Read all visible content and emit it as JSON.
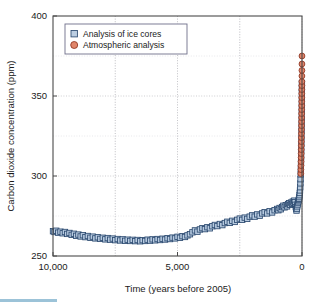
{
  "chart_data": {
    "type": "scatter",
    "title": "",
    "xlabel": "Time (years before 2005)",
    "ylabel": "Carbon dioxide concentration (ppm)",
    "xlim": [
      10000,
      0
    ],
    "ylim": [
      250,
      400
    ],
    "x_ticks": [
      10000,
      5000,
      0
    ],
    "x_tick_labels": [
      "10,000",
      "5,000",
      "0"
    ],
    "y_ticks": [
      250,
      300,
      350,
      400
    ],
    "y_tick_labels": [
      "250",
      "300",
      "350",
      "400"
    ],
    "x_minor_gridlines": [
      7500,
      5000,
      2500
    ],
    "y_minor_gridlines": [
      275,
      325,
      375
    ],
    "grid": true,
    "x_axis_inverted": true,
    "legend_position": "upper left",
    "legend": [
      {
        "label": "Analysis of ice cores",
        "marker": "square",
        "color": "#b8cbe0",
        "edge_color": "#2c4a70"
      },
      {
        "label": "Atmospheric analysis",
        "marker": "circle",
        "color": "#e0856a",
        "edge_color": "#8d3420"
      }
    ],
    "series": [
      {
        "name": "Analysis of ice cores",
        "marker": "square",
        "color": "#b8cbe0",
        "edge_color": "#2c4a70",
        "points": [
          [
            10000,
            265.5
          ],
          [
            9940,
            265.0
          ],
          [
            9870,
            265.8
          ],
          [
            9790,
            264.6
          ],
          [
            9700,
            265.2
          ],
          [
            9610,
            264.2
          ],
          [
            9520,
            265.0
          ],
          [
            9430,
            263.8
          ],
          [
            9340,
            264.4
          ],
          [
            9250,
            263.2
          ],
          [
            9160,
            263.9
          ],
          [
            9070,
            262.6
          ],
          [
            8980,
            263.4
          ],
          [
            8890,
            262.2
          ],
          [
            8800,
            263.0
          ],
          [
            8700,
            261.8
          ],
          [
            8600,
            262.5
          ],
          [
            8500,
            261.4
          ],
          [
            8400,
            262.1
          ],
          [
            8300,
            261.0
          ],
          [
            8200,
            261.7
          ],
          [
            8100,
            260.7
          ],
          [
            8000,
            261.4
          ],
          [
            7900,
            260.4
          ],
          [
            7800,
            261.2
          ],
          [
            7700,
            260.2
          ],
          [
            7600,
            260.9
          ],
          [
            7500,
            259.9
          ],
          [
            7400,
            260.6
          ],
          [
            7300,
            259.7
          ],
          [
            7200,
            260.4
          ],
          [
            7100,
            259.5
          ],
          [
            7000,
            260.2
          ],
          [
            6900,
            259.4
          ],
          [
            6800,
            260.1
          ],
          [
            6700,
            259.3
          ],
          [
            6600,
            260.0
          ],
          [
            6500,
            259.2
          ],
          [
            6400,
            259.9
          ],
          [
            6300,
            259.4
          ],
          [
            6200,
            260.2
          ],
          [
            6100,
            259.6
          ],
          [
            6000,
            260.4
          ],
          [
            5900,
            259.8
          ],
          [
            5800,
            260.6
          ],
          [
            5700,
            260.0
          ],
          [
            5600,
            260.8
          ],
          [
            5500,
            260.3
          ],
          [
            5400,
            261.1
          ],
          [
            5300,
            260.6
          ],
          [
            5200,
            261.5
          ],
          [
            5100,
            261.0
          ],
          [
            5000,
            262.0
          ],
          [
            4900,
            261.4
          ],
          [
            4800,
            262.4
          ],
          [
            4700,
            261.9
          ],
          [
            4600,
            262.9
          ],
          [
            4500,
            263.6
          ],
          [
            4400,
            264.8
          ],
          [
            4300,
            266.0
          ],
          [
            4200,
            265.2
          ],
          [
            4100,
            266.6
          ],
          [
            4000,
            267.4
          ],
          [
            3900,
            266.8
          ],
          [
            3800,
            268.0
          ],
          [
            3700,
            267.3
          ],
          [
            3600,
            268.6
          ],
          [
            3500,
            269.4
          ],
          [
            3400,
            268.7
          ],
          [
            3300,
            270.0
          ],
          [
            3200,
            269.3
          ],
          [
            3100,
            270.6
          ],
          [
            3000,
            271.4
          ],
          [
            2900,
            270.7
          ],
          [
            2800,
            272.0
          ],
          [
            2700,
            271.3
          ],
          [
            2600,
            272.6
          ],
          [
            2500,
            273.4
          ],
          [
            2400,
            272.6
          ],
          [
            2300,
            274.0
          ],
          [
            2200,
            273.2
          ],
          [
            2100,
            274.6
          ],
          [
            2000,
            275.4
          ],
          [
            1900,
            274.6
          ],
          [
            1800,
            276.0
          ],
          [
            1700,
            275.2
          ],
          [
            1600,
            276.6
          ],
          [
            1500,
            277.4
          ],
          [
            1400,
            276.6
          ],
          [
            1300,
            278.0
          ],
          [
            1200,
            277.2
          ],
          [
            1100,
            278.6
          ],
          [
            1000,
            279.4
          ],
          [
            950,
            278.6
          ],
          [
            900,
            280.0
          ],
          [
            850,
            279.2
          ],
          [
            800,
            280.6
          ],
          [
            750,
            281.4
          ],
          [
            700,
            280.4
          ],
          [
            650,
            281.8
          ],
          [
            600,
            281.0
          ],
          [
            560,
            282.4
          ],
          [
            520,
            283.0
          ],
          [
            480,
            282.0
          ],
          [
            440,
            283.4
          ],
          [
            400,
            282.6
          ],
          [
            370,
            284.0
          ],
          [
            340,
            283.2
          ],
          [
            310,
            284.6
          ],
          [
            290,
            283.6
          ],
          [
            270,
            282.0
          ],
          [
            250,
            280.6
          ],
          [
            235,
            279.4
          ],
          [
            220,
            278.4
          ],
          [
            205,
            279.6
          ],
          [
            190,
            281.0
          ],
          [
            175,
            282.2
          ],
          [
            160,
            283.4
          ],
          [
            145,
            284.2
          ],
          [
            130,
            285.0
          ],
          [
            118,
            285.8
          ],
          [
            108,
            286.8
          ],
          [
            98,
            288.0
          ],
          [
            88,
            289.4
          ],
          [
            80,
            291.0
          ],
          [
            72,
            293.0
          ],
          [
            64,
            295.4
          ],
          [
            58,
            298.0
          ],
          [
            52,
            301.0
          ],
          [
            46,
            304.4
          ],
          [
            40,
            308.2
          ],
          [
            35,
            312.0
          ],
          [
            30,
            316.0
          ],
          [
            26,
            320.0
          ],
          [
            22,
            324.0
          ],
          [
            18,
            328.0
          ],
          [
            15,
            332.0
          ],
          [
            12,
            336.0
          ],
          [
            10,
            340.0
          ],
          [
            8,
            344.0
          ],
          [
            6,
            348.0
          ],
          [
            5,
            352.0
          ],
          [
            4,
            355.0
          ],
          [
            3,
            358.0
          ]
        ]
      },
      {
        "name": "Atmospheric analysis",
        "marker": "circle",
        "color": "#e0856a",
        "edge_color": "#8d3420",
        "points": [
          [
            48,
            301.5
          ],
          [
            44,
            304.0
          ],
          [
            41,
            306.5
          ],
          [
            38,
            309.0
          ],
          [
            35,
            311.5
          ],
          [
            33,
            314.0
          ],
          [
            31,
            316.5
          ],
          [
            29,
            319.0
          ],
          [
            27,
            321.5
          ],
          [
            25,
            324.0
          ],
          [
            23,
            326.5
          ],
          [
            21,
            329.0
          ],
          [
            19,
            331.5
          ],
          [
            17,
            334.0
          ],
          [
            15,
            336.5
          ],
          [
            14,
            339.0
          ],
          [
            12,
            341.5
          ],
          [
            11,
            344.0
          ],
          [
            10,
            346.5
          ],
          [
            9,
            349.0
          ],
          [
            8,
            351.5
          ],
          [
            7,
            354.0
          ],
          [
            6,
            356.5
          ],
          [
            5,
            359.0
          ],
          [
            4,
            362.5
          ],
          [
            3,
            366.0
          ],
          [
            2,
            370.0
          ],
          [
            1,
            375.0
          ]
        ]
      }
    ]
  },
  "plot_geometry": {
    "left": 53,
    "right": 302,
    "top": 16,
    "bottom": 256
  },
  "legend_geometry": {
    "x": 65,
    "y": 24,
    "width": 122,
    "height": 30
  }
}
